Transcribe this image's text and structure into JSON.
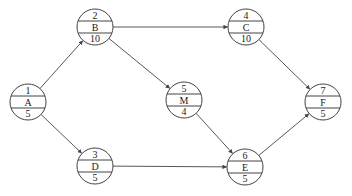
{
  "diagram": {
    "type": "activity-on-node network",
    "nodes": [
      {
        "id": "1",
        "activity": "A",
        "duration": "5",
        "cx": 28,
        "cy": 102
      },
      {
        "id": "2",
        "activity": "B",
        "duration": "10",
        "cx": 95,
        "cy": 27
      },
      {
        "id": "3",
        "activity": "D",
        "duration": "5",
        "cx": 95,
        "cy": 166
      },
      {
        "id": "4",
        "activity": "C",
        "duration": "10",
        "cx": 246,
        "cy": 27
      },
      {
        "id": "5",
        "activity": "M",
        "duration": "4",
        "cx": 184,
        "cy": 100
      },
      {
        "id": "6",
        "activity": "E",
        "duration": "5",
        "cx": 245,
        "cy": 167
      },
      {
        "id": "7",
        "activity": "F",
        "duration": "5",
        "cx": 323,
        "cy": 102
      }
    ],
    "edges": [
      {
        "from": "1",
        "to": "2"
      },
      {
        "from": "1",
        "to": "3"
      },
      {
        "from": "2",
        "to": "4"
      },
      {
        "from": "2",
        "to": "5"
      },
      {
        "from": "3",
        "to": "6"
      },
      {
        "from": "5",
        "to": "6"
      },
      {
        "from": "4",
        "to": "7"
      },
      {
        "from": "6",
        "to": "7"
      }
    ]
  }
}
